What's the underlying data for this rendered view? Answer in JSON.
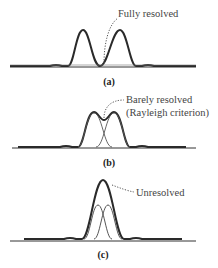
{
  "figure": {
    "panels": [
      {
        "id": "a",
        "caption": "(a)",
        "annotation": "Fully resolved",
        "annotation_lines": [
          "Fully resolved"
        ]
      },
      {
        "id": "b",
        "caption": "(b)",
        "annotation": "Barely resolved (Rayleigh criterion)",
        "annotation_lines": [
          "Barely resolved",
          "(Rayleigh criterion)"
        ]
      },
      {
        "id": "c",
        "caption": "(c)",
        "annotation": "Unresolved",
        "annotation_lines": [
          "Unresolved"
        ]
      }
    ],
    "colors": {
      "curve": "#2a2a2a",
      "component": "#555555",
      "baseline": "#333333",
      "text": "#444444"
    }
  }
}
